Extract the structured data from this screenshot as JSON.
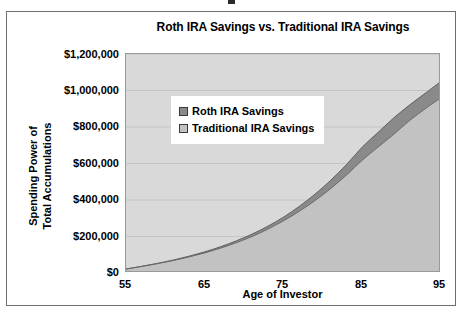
{
  "chart_data": {
    "type": "area",
    "title": "Roth IRA Savings vs. Traditional IRA Savings",
    "xlabel": "Age of Investor",
    "ylabel": "Spending Power of Total Accumulations",
    "ylabel_line1": "Spending Power of",
    "ylabel_line2": "Total Accumulations",
    "xlim": [
      55,
      95
    ],
    "ylim": [
      0,
      1200000
    ],
    "xticks": [
      55,
      65,
      75,
      85,
      95
    ],
    "xtick_labels": [
      "55",
      "65",
      "75",
      "85",
      "95"
    ],
    "xtick_minor_step": 1,
    "yticks": [
      0,
      200000,
      400000,
      600000,
      800000,
      1000000,
      1200000
    ],
    "ytick_labels": [
      "$0",
      "$200,000",
      "$400,000",
      "$600,000",
      "$800,000",
      "$1,000,000",
      "$1,200,000"
    ],
    "grid": true,
    "legend_position": "upper-left-inside",
    "plot_background": "#d9d9d9",
    "x": [
      55,
      57,
      59,
      61,
      63,
      65,
      67,
      69,
      71,
      73,
      75,
      77,
      79,
      81,
      83,
      85,
      87,
      89,
      91,
      93,
      95
    ],
    "series": [
      {
        "name": "Roth IRA Savings",
        "color": "#8a8a8a",
        "values": [
          22000,
          37000,
          53000,
          71000,
          92000,
          116000,
          144000,
          176000,
          213000,
          256000,
          306000,
          365000,
          432000,
          508000,
          594000,
          690000,
          770000,
          850000,
          920000,
          985000,
          1050000
        ]
      },
      {
        "name": "Traditional IRA Savings",
        "color": "#c2c2c2",
        "values": [
          21000,
          36000,
          51000,
          68000,
          88000,
          110000,
          136000,
          166000,
          200000,
          240000,
          286000,
          338000,
          397000,
          463000,
          537000,
          618000,
          690000,
          760000,
          835000,
          900000,
          960000
        ]
      }
    ]
  },
  "legend": {
    "items": [
      {
        "label": "Roth IRA Savings",
        "color": "#8a8a8a"
      },
      {
        "label": "Traditional IRA Savings",
        "color": "#c2c2c2"
      }
    ]
  }
}
